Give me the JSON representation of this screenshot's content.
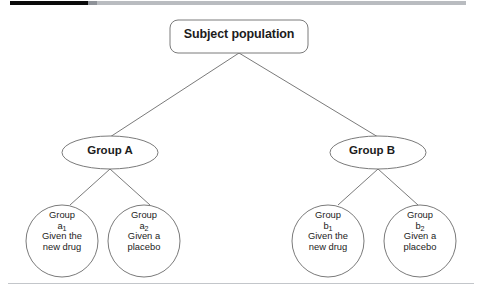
{
  "page": {
    "background": "#ffffff",
    "width": 482,
    "height": 298
  },
  "progress_bar": {
    "name": "scrollbar",
    "fill_color": "#0b0b0b",
    "track_color": "#b9bcc0",
    "knob_color": "#8e9298"
  },
  "divider": {
    "color": "#c3c6ca"
  },
  "diagram": {
    "title": "Subject population",
    "stroke_color": "#6b6b6b",
    "text_color": "#1c1c1c",
    "root": {
      "label": "Subject population",
      "shape": "rounded-rectangle"
    },
    "groups": [
      {
        "label": "Group A",
        "shape": "ellipse"
      },
      {
        "label": "Group B",
        "shape": "ellipse"
      }
    ],
    "leaves": [
      {
        "shape": "circle",
        "line1": "Group",
        "base": "a",
        "subscript": "1",
        "line3": "Given the",
        "line4": "new drug"
      },
      {
        "shape": "circle",
        "line1": "Group",
        "base": "a",
        "subscript": "2",
        "line3": "Given a",
        "line4": "placebo"
      },
      {
        "shape": "circle",
        "line1": "Group",
        "base": "b",
        "subscript": "1",
        "line3": "Given the",
        "line4": "new drug"
      },
      {
        "shape": "circle",
        "line1": "Group",
        "base": "b",
        "subscript": "2",
        "line3": "Given a",
        "line4": "placebo"
      }
    ]
  }
}
